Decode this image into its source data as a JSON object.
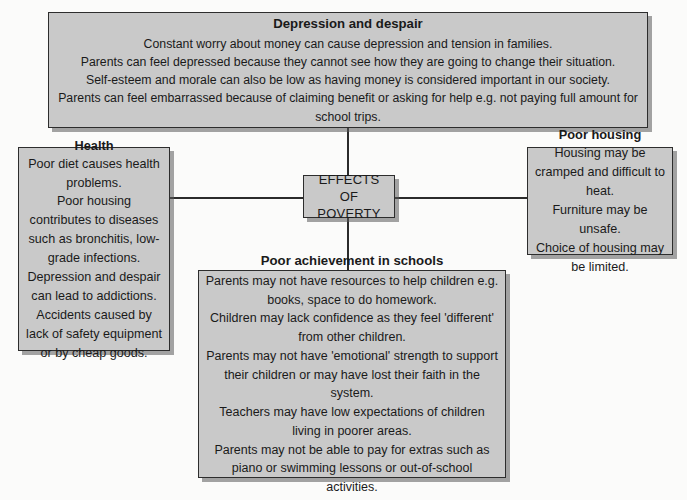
{
  "diagram": {
    "center": {
      "label_line1": "EFFECTS OF",
      "label_line2": "POVERTY"
    },
    "nodes": {
      "depression": {
        "title": "Depression and despair",
        "lines": [
          "Constant worry about money can cause depression and tension in families.",
          "Parents can feel depressed because they cannot see how they are going to change their situation.",
          "Self-esteem and morale can also be low as having money is considered important in our society.",
          "Parents can feel embarrassed because of claiming benefit or asking for help e.g. not paying full amount for school trips."
        ]
      },
      "health": {
        "title": "Health",
        "lines": [
          "Poor diet causes health problems.",
          "Poor housing contributes to diseases such as bronchitis, low-grade infections.",
          "Depression and despair can lead to addictions.",
          "Accidents caused by lack of safety equipment or by cheap goods."
        ]
      },
      "housing": {
        "title": "Poor housing",
        "lines": [
          "Housing may be cramped and difficult to heat.",
          "Furniture may be unsafe.",
          "Choice of housing may be limited."
        ]
      },
      "school": {
        "title": "Poor achievement in schools",
        "lines": [
          "Parents may not have resources to help children e.g. books, space to do homework.",
          "Children may lack confidence as they feel 'different' from other children.",
          "Parents may not have 'emotional' strength to support their children or may have lost their faith in the system.",
          "Teachers may have low expectations of children living in poorer areas.",
          "Parents may not be able to pay for extras such as piano or swimming lessons or out-of-school activities."
        ]
      }
    },
    "colors": {
      "box_fill": "#c9c9c9",
      "box_border": "#2d2d2d",
      "connector": "#2b2b2b",
      "background": "#fbfbfa",
      "text": "#1a1a1a"
    }
  }
}
